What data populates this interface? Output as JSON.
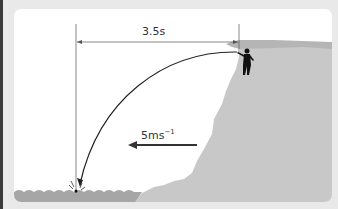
{
  "diagram": {
    "type": "projectile-from-cliff",
    "time_label": "3.5s",
    "velocity_label_base": "5ms",
    "velocity_label_exp": "−1",
    "elements": [
      "person-on-cliff",
      "curved-trajectory-arrow",
      "time-dimension-line",
      "velocity-arrow",
      "cliff",
      "water-surface",
      "splash"
    ],
    "colors": {
      "background": "#e9e9e9",
      "panel": "#ffffff",
      "cliff": "#c8c8c8",
      "cliff_top": "#b5b5b5",
      "water": "#a6a6a6",
      "lines": "#222222"
    }
  }
}
